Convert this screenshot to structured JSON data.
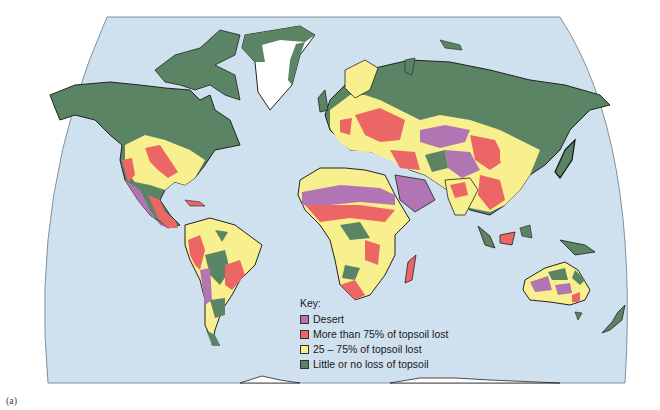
{
  "map": {
    "projection": "world map, curved (Robinson-like) ocean outline",
    "colors": {
      "ocean": "#cfe0ee",
      "desert": "#b275b3",
      "severe_loss": "#ec6665",
      "moderate_loss": "#f8f08e",
      "little_loss": "#5b8465",
      "ice": "#ffffff",
      "outline": "#222222"
    }
  },
  "key": {
    "title": "Key:",
    "items": [
      {
        "label": "Desert",
        "color": "#b275b3"
      },
      {
        "label": "More than 75% of topsoil lost",
        "color": "#ec6665"
      },
      {
        "label": "25 – 75% of topsoil lost",
        "color": "#f8f08e"
      },
      {
        "label": "Little or no loss of topsoil",
        "color": "#5b8465"
      }
    ]
  },
  "caption": "(a)"
}
